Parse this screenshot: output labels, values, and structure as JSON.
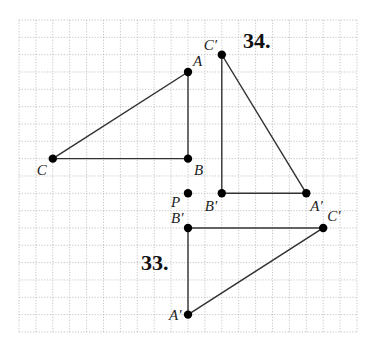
{
  "grid": {
    "origin_x": 19,
    "origin_y": 20,
    "cell_w": 16.9,
    "cell_h": 17.33,
    "cols": 20,
    "rows": 18,
    "line_color": "#b8b8b8"
  },
  "colors": {
    "line": "#333333",
    "point": "#000000"
  },
  "problems": [
    {
      "number": "34.",
      "number_pos": [
        243,
        48
      ],
      "original": {
        "points": [
          {
            "name": "A",
            "col": 10,
            "row": 3,
            "label": "A",
            "label_dx": 5,
            "label_dy": -6
          },
          {
            "name": "B",
            "col": 10,
            "row": 8,
            "label": "B",
            "label_dx": 6,
            "label_dy": 16
          },
          {
            "name": "C",
            "col": 2,
            "row": 8,
            "label": "C",
            "label_dx": -16,
            "label_dy": 16
          }
        ]
      },
      "image": {
        "points": [
          {
            "name": "C'",
            "col": 12,
            "row": 2,
            "label": "C′",
            "label_dx": -18,
            "label_dy": -5
          },
          {
            "name": "B'",
            "col": 12,
            "row": 10,
            "label": "B′",
            "label_dx": -17,
            "label_dy": 18
          },
          {
            "name": "A'",
            "col": 17,
            "row": 10,
            "label": "A′",
            "label_dx": 4,
            "label_dy": 18
          }
        ]
      }
    },
    {
      "number": "33.",
      "number_pos": [
        141,
        270
      ],
      "image": {
        "points": [
          {
            "name": "B'",
            "col": 10,
            "row": 12,
            "label": "B′",
            "label_dx": -17,
            "label_dy": -5
          },
          {
            "name": "C'",
            "col": 18,
            "row": 12,
            "label": "C′",
            "label_dx": 4,
            "label_dy": -7
          },
          {
            "name": "A'",
            "col": 10,
            "row": 17,
            "label": "A′",
            "label_dx": -19,
            "label_dy": 5
          }
        ]
      }
    }
  ],
  "center_point": {
    "name": "P",
    "col": 10,
    "row": 10,
    "label": "P",
    "label_dx": -17,
    "label_dy": 14
  }
}
